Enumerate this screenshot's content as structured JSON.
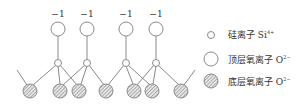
{
  "diagram": {
    "charge_labels": [
      "−1",
      "−1",
      "−1",
      "−1"
    ],
    "colors": {
      "stroke": "#8a8a8a",
      "hatch_fill": "#d0d0d0",
      "text": "#333333"
    }
  },
  "legend": {
    "items": [
      {
        "symbol": "small-open-circle",
        "label": "硅离子 Si",
        "sup": "4+"
      },
      {
        "symbol": "large-open-circle",
        "label": "顶层氧离子 O",
        "sup": "2−"
      },
      {
        "symbol": "hatched-circle",
        "label": "底层氧离子 O",
        "sup": "2−"
      }
    ]
  }
}
